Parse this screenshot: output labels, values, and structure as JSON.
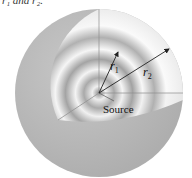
{
  "figure": {
    "caption_fragment": "r₁ and r₂.",
    "labels": {
      "r1": "r",
      "r1_sub": "1",
      "r2": "r",
      "r2_sub": "2",
      "source": "Source"
    },
    "colors": {
      "sphere_outer": "#b8b8b8",
      "sphere_light": "#f4f4f4",
      "ring_dark": "#9a9a9a",
      "line": "#777777",
      "arrow": "#222222"
    },
    "geometry": {
      "center": [
        99,
        93
      ],
      "radius": 84
    }
  }
}
